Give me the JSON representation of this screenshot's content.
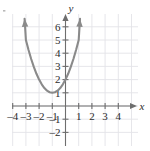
{
  "chart_data": {
    "type": "line",
    "title": "",
    "xlabel": "x",
    "ylabel": "y",
    "xlim": [
      -4.7,
      4.7
    ],
    "ylim": [
      -2.7,
      6.8
    ],
    "grid": true,
    "legend": null,
    "curve": {
      "name": "parabola",
      "equation": "y = x^2 + 2x + 2",
      "vertex": [
        -1,
        1
      ],
      "y_intercept": [
        0,
        2
      ],
      "color": "#8a8a8a",
      "arrow_start": true,
      "arrow_end": true,
      "x": [
        -3.1,
        -3.0,
        -2.8,
        -2.6,
        -2.4,
        -2.2,
        -2.0,
        -1.8,
        -1.6,
        -1.4,
        -1.2,
        -1.0,
        -0.8,
        -0.6,
        -0.4,
        -0.2,
        0.0,
        0.2,
        0.4,
        0.6,
        0.8,
        1.0,
        1.1
      ],
      "y": [
        6.61,
        5.0,
        4.24,
        3.56,
        2.96,
        2.44,
        2.0,
        1.64,
        1.36,
        1.16,
        1.04,
        1.0,
        1.04,
        1.16,
        1.36,
        1.64,
        2.0,
        2.44,
        2.96,
        3.56,
        4.24,
        5.0,
        6.61
      ]
    },
    "x_ticks": [
      {
        "value": -4,
        "label": "–4"
      },
      {
        "value": -3,
        "label": "–3"
      },
      {
        "value": -2,
        "label": "–2"
      },
      {
        "value": -1,
        "label": "–1"
      },
      {
        "value": 1,
        "label": "1"
      },
      {
        "value": 2,
        "label": "2"
      },
      {
        "value": 3,
        "label": "3"
      },
      {
        "value": 4,
        "label": "4"
      }
    ],
    "y_ticks": [
      {
        "value": 6,
        "label": "6"
      },
      {
        "value": 5,
        "label": "5"
      },
      {
        "value": 4,
        "label": "4"
      },
      {
        "value": 3,
        "label": "3"
      },
      {
        "value": 2,
        "label": "2"
      },
      {
        "value": 1,
        "label": "1"
      },
      {
        "value": -1,
        "label": "–1"
      },
      {
        "value": -2,
        "label": "–2"
      }
    ],
    "colors": {
      "grid": "#e3e3e8",
      "axis": "#6e6e6e",
      "curve": "#8a8a8a",
      "text": "#2b2b2b",
      "background": "#ffffff"
    }
  }
}
